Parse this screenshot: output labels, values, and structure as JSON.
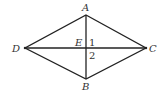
{
  "diagram": {
    "type": "rhombus-with-diagonals",
    "stroke_color": "#222222",
    "vertices": {
      "A": {
        "label": "A",
        "x": 86,
        "y": 15
      },
      "B": {
        "label": "B",
        "x": 86,
        "y": 79
      },
      "C": {
        "label": "C",
        "x": 146,
        "y": 48
      },
      "D": {
        "label": "D",
        "x": 25,
        "y": 48
      }
    },
    "intersection": {
      "label": "E",
      "x": 86,
      "y": 48
    },
    "angle_labels": [
      {
        "label": "1",
        "x": 91,
        "y": 46
      },
      {
        "label": "2",
        "x": 91,
        "y": 58
      }
    ]
  }
}
